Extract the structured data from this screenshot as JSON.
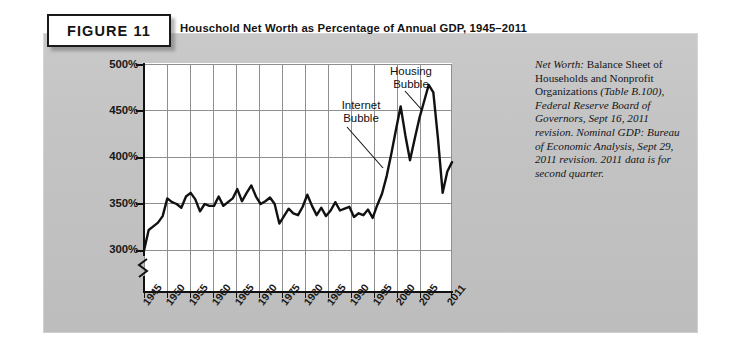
{
  "figure": {
    "tag": "FIGURE 11",
    "title": "Houschold Net Worth as Percentage of Annual GDP, 1945–2011"
  },
  "source_note": {
    "lead_label": "Net Worth:",
    "body_1": " Balance Sheet of Households and Nonprofit Organizations ",
    "italic_1": "(Table B.100), Federal Reserve Board of Governors, Sept 16, 2011 revision. Nominal GDP: Bureau of Economic Analysis, Sept 29, 2011 revision. 2011 data is for second quarter.",
    "full_text": "Net Worth: Balance Sheet of Households and Nonprofit Organizations (Table B.100), Federal Reserve Board of Governors, Sept 16, 2011 revision. Nominal GDP: Bureau of Economic Analysis, Sept 29, 2011 revision. 2011 data is for second quarter."
  },
  "colors": {
    "panel_background": "#c4c4c4",
    "plot_background": "#ffffff",
    "line": "#111111",
    "gridline": "#8f8f8f",
    "axis": "#111111",
    "text": "#141414"
  },
  "chart_data": {
    "type": "line",
    "title": "Houschold Net Worth as Percentage of Annual GDP, 1945–2011",
    "xlabel": "",
    "ylabel": "",
    "xlim": [
      1945,
      2011
    ],
    "ylim": [
      290,
      500
    ],
    "grid": true,
    "y_axis_break": true,
    "y_axis_break_note": "axis broken below 300%",
    "legend_position": "none",
    "ytick_labels": [
      "500%",
      "450%",
      "400%",
      "350%",
      "300%"
    ],
    "ytick_values": [
      500,
      450,
      400,
      350,
      300
    ],
    "xtick_labels": [
      "1945",
      "1950",
      "1955",
      "1960",
      "1965",
      "1970",
      "1975",
      "1980",
      "1985",
      "1990",
      "1995",
      "2000",
      "2005",
      "2011"
    ],
    "xtick_values": [
      1945,
      1950,
      1955,
      1960,
      1965,
      1970,
      1975,
      1980,
      1985,
      1990,
      1995,
      2000,
      2005,
      2011
    ],
    "annotations": [
      {
        "label": "Internet Bubble",
        "line1": "Internet",
        "line2": "Bubble",
        "points_to_year": 1999,
        "points_to_value": 455
      },
      {
        "label": "Housing Bubble",
        "line1": "Housing",
        "line2": "Bubble",
        "points_to_year": 2006,
        "points_to_value": 478
      }
    ],
    "series": [
      {
        "name": "Household Net Worth as % of Annual GDP",
        "x": [
          1945,
          1946,
          1947,
          1948,
          1949,
          1950,
          1951,
          1952,
          1953,
          1954,
          1955,
          1956,
          1957,
          1958,
          1959,
          1960,
          1961,
          1962,
          1963,
          1964,
          1965,
          1966,
          1967,
          1968,
          1969,
          1970,
          1971,
          1972,
          1973,
          1974,
          1975,
          1976,
          1977,
          1978,
          1979,
          1980,
          1981,
          1982,
          1983,
          1984,
          1985,
          1986,
          1987,
          1988,
          1989,
          1990,
          1991,
          1992,
          1993,
          1994,
          1995,
          1996,
          1997,
          1998,
          1999,
          2000,
          2001,
          2002,
          2003,
          2004,
          2005,
          2006,
          2007,
          2008,
          2009,
          2010,
          2011
        ],
        "values": [
          300,
          322,
          326,
          330,
          337,
          356,
          352,
          350,
          346,
          358,
          362,
          355,
          342,
          350,
          348,
          348,
          358,
          348,
          352,
          356,
          366,
          353,
          362,
          370,
          358,
          350,
          353,
          357,
          350,
          329,
          337,
          345,
          340,
          338,
          347,
          360,
          348,
          338,
          346,
          337,
          343,
          352,
          343,
          345,
          347,
          336,
          340,
          338,
          344,
          335,
          349,
          361,
          380,
          404,
          430,
          455,
          424,
          397,
          420,
          442,
          460,
          478,
          470,
          420,
          362,
          385,
          395
        ]
      }
    ]
  }
}
